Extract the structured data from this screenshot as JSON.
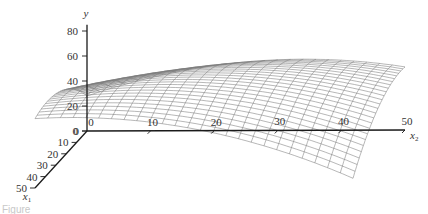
{
  "chart_data": {
    "type": "surface3d-wireframe",
    "title": "",
    "axes": {
      "y": {
        "label": "y",
        "ticks": [
          0,
          20,
          40,
          60,
          80
        ],
        "range": [
          0,
          85
        ]
      },
      "x1": {
        "label": "x",
        "subscript": "1",
        "ticks": [
          0,
          10,
          20,
          30,
          40,
          50
        ],
        "range": [
          0,
          50
        ]
      },
      "x2": {
        "label": "x",
        "subscript": "2",
        "ticks": [
          0,
          10,
          20,
          30,
          40,
          50
        ],
        "range": [
          0,
          50
        ]
      }
    },
    "surface": {
      "model": "y = b0 + b1*x1 + b2*x2 + b11*x1^2 + b22*x2^2 + b12*x1*x2",
      "coefficients": {
        "b0": 28,
        "b1": 1.6,
        "b2": 1.7,
        "b11": -0.021,
        "b22": -0.025,
        "b12": -0.0284
      },
      "approx_corner_values": {
        "x1_0_x2_0": 28,
        "x1_50_x2_0": 55,
        "x1_0_x2_50": 51,
        "x1_50_x2_50": 7
      },
      "approx_max_y": 72,
      "grid_lines_per_axis": 25
    },
    "grid": false,
    "legend": null
  },
  "projection": {
    "origin": [
      87,
      131
    ],
    "x2_unit": [
      6.36,
      -0.02
    ],
    "x1_unit": [
      -1.04,
      1.14
    ],
    "y_unit": [
      0,
      -1.25
    ]
  },
  "caption": "Figure"
}
